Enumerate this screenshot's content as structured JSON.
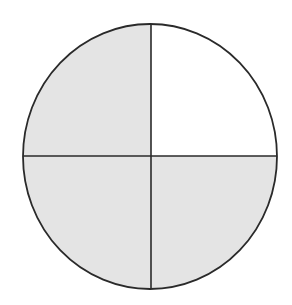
{
  "diagram": {
    "type": "fraction-circle",
    "total_parts": 4,
    "shaded_parts": 3,
    "unshaded_part": "top-right",
    "quadrants": [
      {
        "position": "top-left",
        "shaded": true
      },
      {
        "position": "top-right",
        "shaded": false
      },
      {
        "position": "bottom-left",
        "shaded": true
      },
      {
        "position": "bottom-right",
        "shaded": true
      }
    ],
    "colors": {
      "shaded": "#e4e4e4",
      "unshaded": "#ffffff",
      "stroke": "#2a2a2a"
    }
  }
}
